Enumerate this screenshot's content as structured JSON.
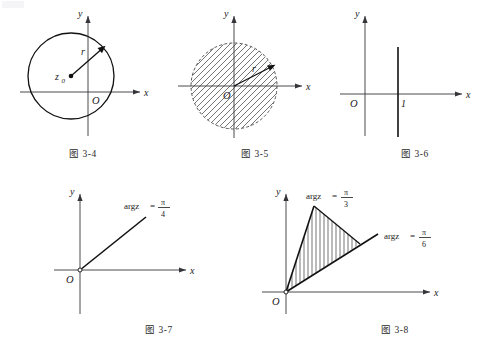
{
  "page": {
    "background_color": "#ffffff",
    "ink_color": "#1a1a1a",
    "width": 480,
    "height": 354
  },
  "figures": [
    {
      "id": "fig-3-4",
      "caption": "图 3-4",
      "description": "Circle of radius r centered at z0 in the complex plane",
      "axis_x_label": "x",
      "axis_y_label": "y",
      "origin_label": "O",
      "labels": {
        "center": "z",
        "center_sub": "0",
        "radius": "r"
      },
      "shape": "circle",
      "boundary": "solid",
      "filled": false
    },
    {
      "id": "fig-3-5",
      "caption": "图 3-5",
      "description": "Hatched open disk of radius r centered at the origin",
      "axis_x_label": "x",
      "axis_y_label": "y",
      "origin_label": "O",
      "labels": {
        "radius": "r"
      },
      "shape": "disk",
      "boundary": "dashed",
      "filled": true,
      "hatching": "diagonal"
    },
    {
      "id": "fig-3-6",
      "caption": "图 3-6",
      "description": "Vertical line through x = 1",
      "axis_x_label": "x",
      "axis_y_label": "y",
      "origin_label": "O",
      "labels": {
        "tick": "1"
      },
      "shape": "vertical-line",
      "boundary": "solid",
      "filled": false
    },
    {
      "id": "fig-3-7",
      "caption": "图 3-7",
      "description": "Ray from origin at argument pi/4",
      "axis_x_label": "x",
      "axis_y_label": "y",
      "origin_label": "O",
      "labels": {
        "arg": "argz",
        "equals": "=",
        "numerator": "π",
        "denominator": "4"
      },
      "shape": "ray",
      "angle_degrees": 45,
      "boundary": "solid",
      "filled": false
    },
    {
      "id": "fig-3-8",
      "caption": "图 3-8",
      "description": "Hatched sector between argument pi/6 and pi/3",
      "axis_x_label": "x",
      "axis_y_label": "y",
      "origin_label": "O",
      "labels": {
        "upper_arg": "argz",
        "upper_equals": "=",
        "upper_numerator": "π",
        "upper_denominator": "3",
        "lower_arg": "argz",
        "lower_equals": "=",
        "lower_numerator": "π",
        "lower_denominator": "6"
      },
      "shape": "sector",
      "angle_from_degrees": 30,
      "angle_to_degrees": 60,
      "boundary": "solid",
      "filled": true,
      "hatching": "vertical"
    }
  ]
}
